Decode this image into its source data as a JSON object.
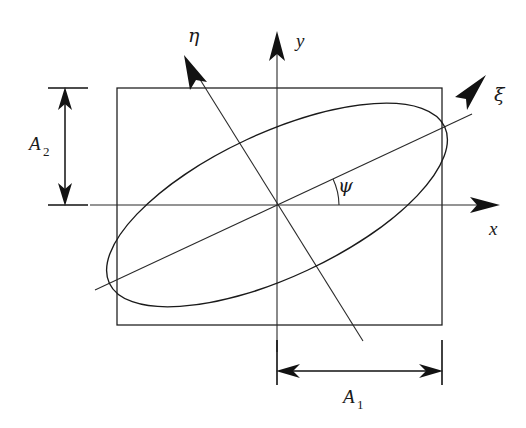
{
  "figure": {
    "type": "geometry-diagram",
    "background_color": "#ffffff",
    "line_color": "#1a1a1a"
  },
  "axes": {
    "x": {
      "label": "x",
      "kind": "cartesian-horizontal",
      "arrow": "right"
    },
    "y": {
      "label": "y",
      "kind": "cartesian-vertical",
      "arrow": "up"
    },
    "xi": {
      "label": "ξ",
      "kind": "rotated-major",
      "arrow": "up-right",
      "angle_deg": 25
    },
    "eta": {
      "label": "η",
      "kind": "rotated-minor",
      "arrow": "up-left",
      "angle_deg": 115
    }
  },
  "angle": {
    "label": "ψ",
    "description": "rotation angle between x axis and xi axis",
    "value_deg": 25
  },
  "dimensions": [
    {
      "name": "A_2",
      "label": "A",
      "subscript": "2",
      "orientation": "vertical",
      "description": "half-height of bounding rectangle"
    },
    {
      "name": "A_1",
      "label": "A",
      "subscript": "1",
      "orientation": "horizontal",
      "description": "half-width of bounding rectangle"
    }
  ],
  "shapes": {
    "rectangle": {
      "name": "bounding-rectangle",
      "left": 117,
      "top": 88,
      "right": 442,
      "bottom": 325
    },
    "ellipse": {
      "name": "inscribed-ellipse",
      "center_x": 277,
      "center_y": 205,
      "semi_major": 185,
      "semi_minor": 72,
      "rotation_deg": -25
    }
  }
}
